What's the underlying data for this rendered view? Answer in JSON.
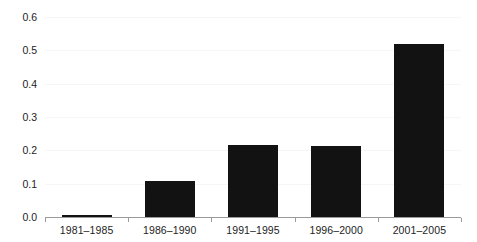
{
  "chart_data": {
    "type": "bar",
    "title": "",
    "subtitle": "",
    "xlabel": "",
    "ylabel": "",
    "categories": [
      "1981–1985",
      "1986–1990",
      "1991–1995",
      "1996–2000",
      "2001–2005"
    ],
    "values": [
      0.007,
      0.107,
      0.215,
      0.212,
      0.518
    ],
    "series": [
      {
        "name": "",
        "values": [
          0.007,
          0.107,
          0.215,
          0.212,
          0.518
        ]
      }
    ],
    "ylim": [
      0.0,
      0.6
    ],
    "ytick_labels": [
      "0.0",
      "0.1",
      "0.2",
      "0.3",
      "0.4",
      "0.5",
      "0.6"
    ],
    "ytick_values": [
      0.0,
      0.1,
      0.2,
      0.3,
      0.4,
      0.5,
      0.6
    ],
    "grid": true,
    "grid_axis": "y",
    "legend": false,
    "legend_position": "none",
    "bar_color": "#121212",
    "background_color": "#ffffff",
    "gridline_color": "#f6f6f6",
    "axis_color": "#9a9a9a",
    "text_color": "#1d1d1d"
  }
}
